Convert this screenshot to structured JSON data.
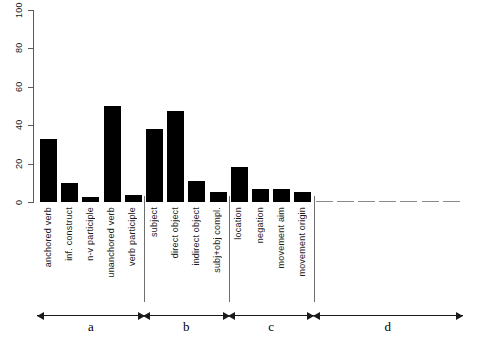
{
  "chart_data": {
    "type": "bar",
    "title": "",
    "xlabel": "",
    "ylabel": "",
    "ylim": [
      0,
      100
    ],
    "yticks": [
      0,
      20,
      40,
      60,
      80,
      100
    ],
    "grid": false,
    "legend": null,
    "categories": [
      "anchored verb",
      "inf. construct",
      "n-v participle",
      "unanchored verb",
      "verb participle",
      "subject",
      "direct object",
      "indirect object",
      "subj+obj compl.",
      "location",
      "negation",
      "movement aim",
      "movement origin",
      "",
      "",
      "",
      "",
      "",
      "",
      ""
    ],
    "values": [
      33,
      10,
      2.5,
      50,
      3.5,
      38,
      47.5,
      11,
      5,
      18,
      7,
      7,
      5,
      0,
      0,
      0,
      0,
      0,
      0,
      0
    ],
    "bar_color": "#000000",
    "groups": [
      {
        "letter": "a",
        "label": "a",
        "from_index": 0,
        "to_index": 4
      },
      {
        "letter": "b",
        "label": "b",
        "from_index": 5,
        "to_index": 8
      },
      {
        "letter": "c",
        "label": "c",
        "from_index": 9,
        "to_index": 12
      },
      {
        "letter": "d",
        "label": "d",
        "from_index": 13,
        "to_index": 19
      }
    ]
  }
}
